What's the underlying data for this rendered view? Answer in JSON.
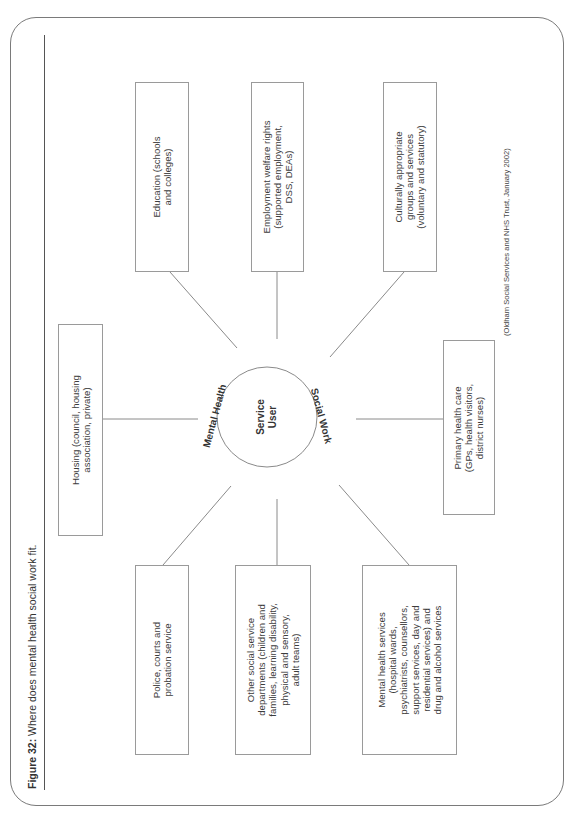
{
  "figure": {
    "title_label": "Figure 32:",
    "title_text": " Where does mental health social work fit.",
    "source": "(Oldham Social Services and NHS Trust, January 2002)"
  },
  "center": {
    "label_line1": "Service",
    "label_line2": "User",
    "arc_left": "Mental Health",
    "arc_right": "Social Work"
  },
  "nodes": {
    "education": {
      "lines": [
        "Education (schools",
        "and colleges)"
      ]
    },
    "employment": {
      "lines": [
        "Employment welfare rights",
        "(supported employment,",
        "DSS, DEAs)"
      ]
    },
    "cultural": {
      "lines": [
        "Culturally appropriate",
        "groups and services",
        "(voluntary and statutory)"
      ]
    },
    "housing": {
      "lines": [
        "Housing (council, housing",
        "association, private)"
      ]
    },
    "primary": {
      "lines": [
        "Primary health care",
        "(GPs, health visitors,",
        "district nurses)"
      ]
    },
    "police": {
      "lines": [
        "Police, courts and",
        "probation service"
      ]
    },
    "other_social": {
      "lines": [
        "Other social service",
        "departments (children and",
        "families, learning disability,",
        "physical and sensory,",
        "adult teams)"
      ]
    },
    "mental_health": {
      "lines": [
        "Mental health services",
        "(hospital wards,",
        "psychiatrists, counsellors,",
        "support services, day and",
        "residential services) and",
        "drug and alcohol services"
      ]
    }
  },
  "colors": {
    "frame": "#7a7a7a",
    "box_border": "#9a9a9a",
    "connector": "#8a8a8a",
    "text": "#3c3c3c"
  }
}
